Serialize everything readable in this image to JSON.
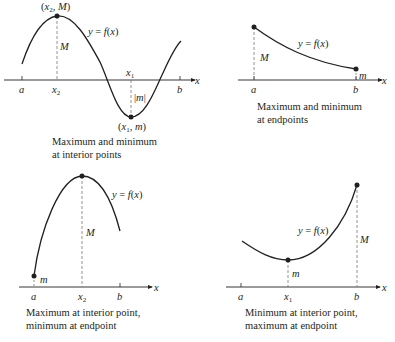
{
  "panels": [
    {
      "id": "interior-both",
      "curve_label": "y = f(x)",
      "axis_label": "x",
      "ticks": [
        "a",
        "x2",
        "x1",
        "b"
      ],
      "max_point_label": "(x2, M)",
      "min_point_label": "(x1, m)",
      "max_height_label": "M",
      "min_height_label": "|m|",
      "caption": [
        "Maximum and minimum",
        "at interior points"
      ]
    },
    {
      "id": "endpoints-both",
      "curve_label": "y = f(x)",
      "axis_label": "x",
      "ticks": [
        "a",
        "b"
      ],
      "max_height_label": "M",
      "min_height_label": "m",
      "caption": [
        "Maximum and minimum",
        "at endpoints"
      ]
    },
    {
      "id": "max-interior-min-endpoint",
      "curve_label": "y = f(x)",
      "axis_label": "x",
      "ticks": [
        "a",
        "x2",
        "b"
      ],
      "max_height_label": "M",
      "min_height_label": "m",
      "caption": [
        "Maximum at interior point,",
        "minimum at endpoint"
      ]
    },
    {
      "id": "min-interior-max-endpoint",
      "curve_label": "y = f(x)",
      "axis_label": "x",
      "ticks": [
        "a",
        "x1",
        "b"
      ],
      "max_height_label": "M",
      "min_height_label": "m",
      "caption": [
        "Minimum at interior point,",
        "maximum at endpoint"
      ]
    }
  ],
  "colors": {
    "ink": "#231f20",
    "dash": "#777777"
  }
}
